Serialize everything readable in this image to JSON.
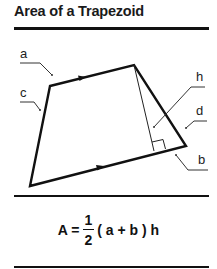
{
  "header": {
    "title": "Area of a Trapezoid"
  },
  "diagram": {
    "labels": {
      "a": "a",
      "b": "b",
      "c": "c",
      "d": "d",
      "h": "h"
    },
    "vertices": {
      "top_left": [
        50,
        86
      ],
      "top_right": [
        134,
        65
      ],
      "bottom_right": [
        186,
        146
      ],
      "bottom_left": [
        30,
        186
      ]
    },
    "colors": {
      "stroke": "#111111",
      "leader": "#333333"
    }
  },
  "formula": {
    "lhs": "A =",
    "numerator": "1",
    "denominator": "2",
    "rhs": "( a + b ) h"
  }
}
